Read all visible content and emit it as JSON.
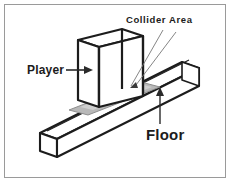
{
  "figure": {
    "background_color": "#ffffff",
    "frame_color": "#9a9a9a",
    "ink_color": "#1c1c1c",
    "collider_fill_color": "#b8b8b8",
    "floor_fill_color": "#ffffff"
  },
  "labels": {
    "collider_area": "Collider Area",
    "player": "Player",
    "floor": "Floor"
  },
  "annotations": {
    "player_arrow": "arrow-right",
    "floor_arrow": "arrow-up",
    "collider_leader": "leader-line"
  },
  "objects": {
    "player": {
      "name": "Player",
      "shape": "thin vertical slab box",
      "rendering": "wireframe outline"
    },
    "floor": {
      "name": "Floor",
      "shape": "long rectangular beam",
      "rendering": "wireframe outline"
    },
    "collider_area": {
      "name": "Collider Area",
      "shape": "flat shaded patch on floor top surface",
      "rendering": "gray filled"
    }
  }
}
